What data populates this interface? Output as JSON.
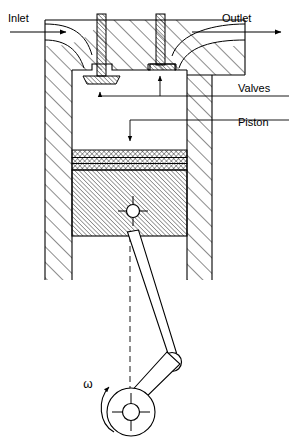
{
  "diagram": {
    "colors": {
      "line": "#000000",
      "hatch": "#000000",
      "background": "#ffffff",
      "thin_line": "#3a3a3a"
    },
    "labels": {
      "inlet": "Inlet",
      "outlet": "Outlet",
      "valves": "Valves",
      "piston": "Piston",
      "omega": "ω"
    },
    "annotations": [
      {
        "name": "inlet",
        "text": "Inlet",
        "x": 8,
        "y": 22,
        "arrow": "right",
        "arrow_from_x": 10,
        "arrow_from_y": 32,
        "arrow_to_x": 68,
        "arrow_to_y": 32
      },
      {
        "name": "outlet",
        "text": "Outlet",
        "x": 222,
        "y": 22,
        "arrow": "right",
        "arrow_from_x": 190,
        "arrow_from_y": 32,
        "arrow_to_x": 283,
        "arrow_to_y": 32
      },
      {
        "name": "valves",
        "text": "Valves",
        "x": 238,
        "y": 92,
        "arrow": "up",
        "targets": [
          "inlet-valve",
          "outlet-valve"
        ]
      },
      {
        "name": "piston",
        "text": "Piston",
        "x": 238,
        "y": 126,
        "arrow": "down",
        "targets": [
          "piston-body"
        ]
      },
      {
        "name": "omega",
        "text": "ω",
        "x": 90,
        "y": 387,
        "arrow": "curved-ccw",
        "targets": [
          "crankshaft"
        ]
      }
    ],
    "parts": [
      {
        "name": "cylinder-wall-left",
        "kind": "hatched-block"
      },
      {
        "name": "cylinder-wall-right",
        "kind": "hatched-block"
      },
      {
        "name": "cylinder-head",
        "kind": "hatched-block"
      },
      {
        "name": "combustion-chamber",
        "kind": "void"
      },
      {
        "name": "inlet-valve",
        "state": "open"
      },
      {
        "name": "outlet-valve",
        "state": "closed"
      },
      {
        "name": "piston-rings",
        "count": 3
      },
      {
        "name": "piston-body",
        "kind": "hatched-block"
      },
      {
        "name": "wrist-pin",
        "kind": "pin"
      },
      {
        "name": "connecting-rod",
        "kind": "link"
      },
      {
        "name": "crank-arm",
        "kind": "link"
      },
      {
        "name": "crankshaft",
        "kind": "circle"
      },
      {
        "name": "crank-pin",
        "kind": "pin"
      },
      {
        "name": "centerline",
        "kind": "dashed-axis"
      }
    ]
  }
}
